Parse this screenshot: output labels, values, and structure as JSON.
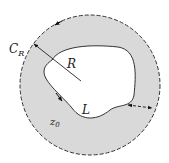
{
  "diagram": {
    "labels": {
      "circle": "C",
      "circle_sub": "R",
      "radius": "R",
      "curve": "L",
      "point": "z",
      "point_sub": "0"
    },
    "colors": {
      "region_fill": "#d9d9d9",
      "stroke": "#333333",
      "background": "#ffffff",
      "inner_fill": "#ffffff"
    }
  }
}
